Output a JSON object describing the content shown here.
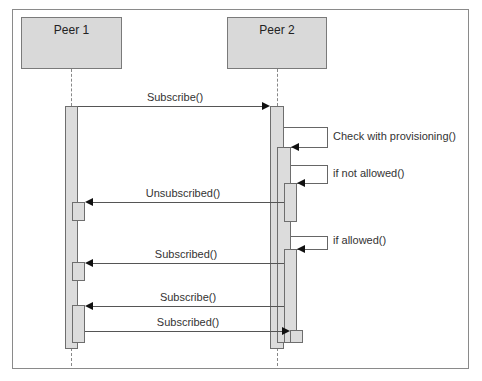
{
  "diagram": {
    "type": "sequence",
    "participants": [
      {
        "name": "Peer 1"
      },
      {
        "name": "Peer 2"
      }
    ],
    "messages": [
      {
        "label": "Subscribe()",
        "from": "Peer 1",
        "to": "Peer 2"
      },
      {
        "label": "Check with provisioning()",
        "from": "Peer 2",
        "to": "Peer 2"
      },
      {
        "label": "if not allowed()",
        "from": "Peer 2",
        "to": "Peer 2"
      },
      {
        "label": "Unsubscribed()",
        "from": "Peer 2",
        "to": "Peer 1"
      },
      {
        "label": "if allowed()",
        "from": "Peer 2",
        "to": "Peer 2"
      },
      {
        "label": "Subscribed()",
        "from": "Peer 2",
        "to": "Peer 1"
      },
      {
        "label": "Subscribe()",
        "from": "Peer 2",
        "to": "Peer 1"
      },
      {
        "label": "Subscribed()",
        "from": "Peer 1",
        "to": "Peer 2"
      }
    ],
    "colors": {
      "participant_fill": "#d9d9d9",
      "activation_fill": "#dcdcdc",
      "line": "#555555",
      "frame": "#8a8a8a"
    }
  }
}
